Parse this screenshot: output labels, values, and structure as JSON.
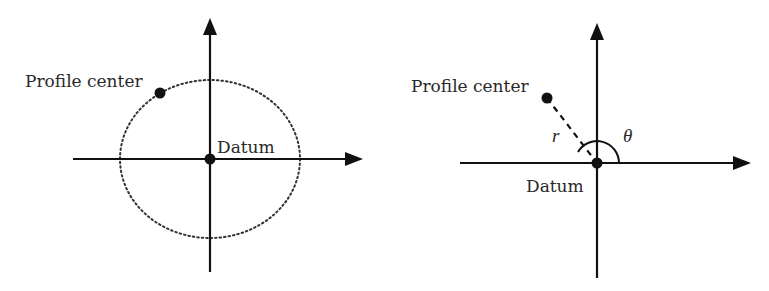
{
  "panels": [
    {
      "name": "left",
      "labels": {
        "profile_center": "Profile center",
        "datum": "Datum"
      },
      "description": "Profile center lies on a dotted ellipse centered at the datum"
    },
    {
      "name": "right",
      "labels": {
        "profile_center": "Profile center",
        "datum": "Datum",
        "radius": "r",
        "angle": "θ"
      },
      "description": "Polar coordinates (r, θ) of the profile center relative to the datum"
    }
  ],
  "colors": {
    "stroke": "#111111",
    "text": "#2a2a2a",
    "background": "#ffffff"
  }
}
